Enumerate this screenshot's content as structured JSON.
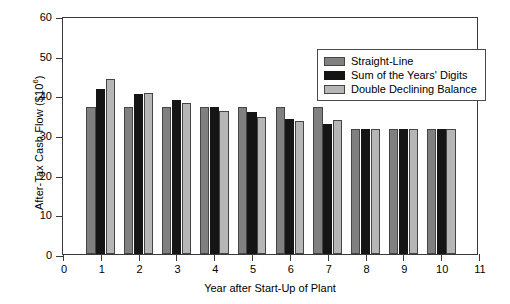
{
  "chart_data": {
    "type": "bar",
    "title": "",
    "xlabel": "Year after Start-Up of Plant",
    "ylabel": "After-Tax Cash Flow ($10⁶)",
    "ylabel_base": "After-Tax Cash Flow ($10",
    "ylabel_exp": "6",
    "ylabel_close": ")",
    "categories": [
      "1",
      "2",
      "3",
      "4",
      "5",
      "6",
      "7",
      "8",
      "9",
      "10"
    ],
    "xlim": [
      0,
      11
    ],
    "ylim": [
      0,
      60
    ],
    "xticks": [
      "0",
      "1",
      "2",
      "3",
      "4",
      "5",
      "6",
      "7",
      "8",
      "9",
      "10",
      "11"
    ],
    "yticks": [
      "0",
      "10",
      "20",
      "30",
      "40",
      "50",
      "60"
    ],
    "grid": false,
    "legend_position": "upper right",
    "series": [
      {
        "name": "Straight-Line",
        "color": "#808080",
        "values": [
          37.0,
          37.0,
          37.0,
          37.0,
          37.0,
          37.0,
          37.0,
          31.5,
          31.5,
          31.5
        ]
      },
      {
        "name": "Sum of the Years' Digits",
        "color": "#151515",
        "values": [
          41.5,
          40.3,
          38.8,
          37.0,
          35.8,
          34.0,
          32.8,
          31.5,
          31.5,
          31.5
        ]
      },
      {
        "name": "Double Declining Balance",
        "color": "#b6b6b6",
        "values": [
          44.0,
          40.5,
          38.0,
          36.0,
          34.5,
          33.5,
          33.8,
          31.5,
          31.5,
          31.5
        ]
      }
    ]
  }
}
